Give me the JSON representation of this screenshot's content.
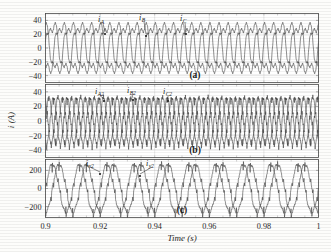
{
  "figure": {
    "name": "three-panel-current-waveform-figure",
    "xlabel": "Time (s)",
    "ylabel": "i (A)",
    "xticks": [
      "0.9",
      "0.92",
      "0.94",
      "0.96",
      "0.98",
      "1"
    ],
    "xlim": [
      0.9,
      1.0
    ],
    "panels": [
      {
        "id": "a",
        "label": "(a)",
        "yticks": [
          "40",
          "20",
          "0",
          "-20",
          "-40"
        ],
        "ylim": [
          -50,
          50
        ],
        "curve_labels": [
          {
            "base": "i",
            "sub": "A"
          },
          {
            "base": "i",
            "sub": "B"
          },
          {
            "base": "i",
            "sub": "C"
          }
        ]
      },
      {
        "id": "b",
        "label": "(b)",
        "yticks": [
          "40",
          "20",
          "0",
          "-20",
          "-40"
        ],
        "ylim": [
          -50,
          50
        ],
        "curve_labels": [
          {
            "base": "i",
            "sub": "A2"
          },
          {
            "base": "i",
            "sub": "B2"
          },
          {
            "base": "i",
            "sub": "C2"
          }
        ]
      },
      {
        "id": "c",
        "label": "(c)",
        "yticks": [
          "200",
          "0",
          "-200"
        ],
        "ylim": [
          -320,
          320
        ],
        "curve_labels": [
          {
            "base": "i",
            "sub": "x2"
          },
          {
            "base": "i",
            "sub": "y2"
          }
        ]
      }
    ]
  },
  "chart_data": [
    {
      "type": "line",
      "panel": "a",
      "title": "(a)",
      "xlabel": "Time (s)",
      "ylabel": "i (A)",
      "xlim": [
        0.9,
        1.0
      ],
      "ylim": [
        -50,
        50
      ],
      "xticks": [
        0.9,
        0.92,
        0.94,
        0.96,
        0.98,
        1.0
      ],
      "yticks": [
        40,
        20,
        0,
        -20,
        -40
      ],
      "grid": true,
      "legend": "inline-annotations",
      "series": [
        {
          "name": "i_A",
          "fundamental_hz": 100,
          "amplitude": 42,
          "phase_deg": 0,
          "waveform": "distorted-trapezoidal-sine"
        },
        {
          "name": "i_B",
          "fundamental_hz": 100,
          "amplitude": 42,
          "phase_deg": -120,
          "waveform": "distorted-trapezoidal-sine"
        },
        {
          "name": "i_C",
          "fundamental_hz": 100,
          "amplitude": 42,
          "phase_deg": 120,
          "waveform": "distorted-trapezoidal-sine"
        }
      ]
    },
    {
      "type": "line",
      "panel": "b",
      "title": "(b)",
      "xlabel": "Time (s)",
      "ylabel": "i (A)",
      "xlim": [
        0.9,
        1.0
      ],
      "ylim": [
        -50,
        50
      ],
      "xticks": [
        0.9,
        0.92,
        0.94,
        0.96,
        0.98,
        1.0
      ],
      "yticks": [
        40,
        20,
        0,
        -20,
        -40
      ],
      "grid": true,
      "legend": "inline-annotations",
      "series": [
        {
          "name": "i_A2",
          "fundamental_hz": 200,
          "amplitude": 32,
          "phase_deg": 0,
          "waveform": "notched-sine"
        },
        {
          "name": "i_B2",
          "fundamental_hz": 200,
          "amplitude": 32,
          "phase_deg": -120,
          "waveform": "notched-sine"
        },
        {
          "name": "i_C2",
          "fundamental_hz": 200,
          "amplitude": 32,
          "phase_deg": 120,
          "waveform": "notched-sine"
        }
      ]
    },
    {
      "type": "line",
      "panel": "c",
      "title": "(c)",
      "xlabel": "Time (s)",
      "ylabel": "i (A)",
      "xlim": [
        0.9,
        1.0
      ],
      "ylim": [
        -320,
        320
      ],
      "xticks": [
        0.9,
        0.92,
        0.94,
        0.96,
        0.98,
        1.0
      ],
      "yticks": [
        200,
        0,
        -200
      ],
      "grid": true,
      "legend": "inline-annotations",
      "series": [
        {
          "name": "i_x2",
          "fundamental_hz": 100,
          "amplitude": 265,
          "phase_deg": 0,
          "waveform": "notched-sine"
        },
        {
          "name": "i_y2",
          "fundamental_hz": 100,
          "amplitude": 265,
          "phase_deg": -90,
          "waveform": "notched-sine"
        }
      ]
    }
  ]
}
